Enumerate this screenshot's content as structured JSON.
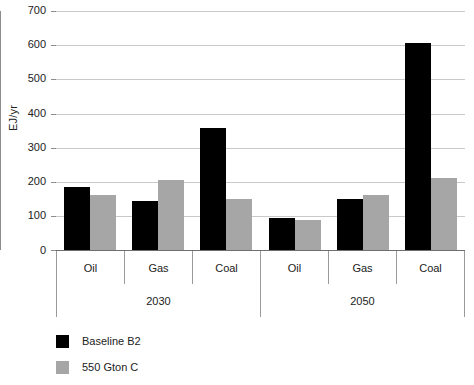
{
  "chart_data": {
    "type": "bar",
    "title": "",
    "xlabel": "",
    "ylabel": "EJ/yr",
    "ylim": [
      0,
      700
    ],
    "ytick_step": 100,
    "yticks": [
      700,
      600,
      500,
      400,
      300,
      200,
      100,
      0
    ],
    "grid": true,
    "legend_position": "bottom-left",
    "group_labels": [
      "2030",
      "2050"
    ],
    "categories": [
      "Oil",
      "Gas",
      "Coal",
      "Oil",
      "Gas",
      "Coal"
    ],
    "series": [
      {
        "name": "Baseline B2",
        "color": "#000000",
        "values": [
          185,
          145,
          358,
          95,
          148,
          605
        ]
      },
      {
        "name": "550 Gton C",
        "color": "#a6a6a6",
        "values": [
          162,
          205,
          150,
          88,
          162,
          211
        ]
      }
    ],
    "groups": [
      {
        "period": "2030",
        "categories": [
          "Oil",
          "Gas",
          "Coal"
        ],
        "baseline_b2": [
          185,
          145,
          358
        ],
        "gton_550_c": [
          162,
          205,
          150
        ]
      },
      {
        "period": "2050",
        "categories": [
          "Oil",
          "Gas",
          "Coal"
        ],
        "baseline_b2": [
          95,
          148,
          605
        ],
        "gton_550_c": [
          88,
          162,
          211
        ]
      }
    ]
  },
  "axis": {
    "y_title": "EJ/yr",
    "y_ticks": [
      "700",
      "600",
      "500",
      "400",
      "300",
      "200",
      "100",
      "0"
    ],
    "x_categories": [
      "Oil",
      "Gas",
      "Coal",
      "Oil",
      "Gas",
      "Coal"
    ],
    "x_groups": [
      "2030",
      "2050"
    ]
  },
  "legend": {
    "items": [
      {
        "label": "Baseline B2",
        "color": "#000000"
      },
      {
        "label": "550 Gton C",
        "color": "#a6a6a6"
      }
    ]
  }
}
